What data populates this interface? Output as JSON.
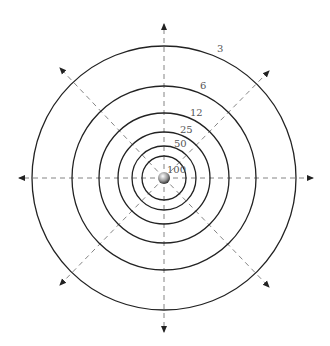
{
  "diagram": {
    "type": "concentric-rings",
    "center": {
      "x": 164,
      "y": 178
    },
    "rings": [
      {
        "label": "3",
        "radius": 132,
        "label_x": 217,
        "label_y": 52
      },
      {
        "label": "6",
        "radius": 92,
        "label_x": 200,
        "label_y": 89
      },
      {
        "label": "12",
        "radius": 65,
        "label_x": 190,
        "label_y": 116
      },
      {
        "label": "25",
        "radius": 46,
        "label_x": 180,
        "label_y": 133
      },
      {
        "label": "50",
        "radius": 32,
        "label_x": 174,
        "label_y": 147
      },
      {
        "label": "100",
        "radius": 22,
        "label_x": 167,
        "label_y": 173
      }
    ],
    "arrows": [
      {
        "name": "up",
        "x": 164,
        "y": 24
      },
      {
        "name": "down",
        "x": 164,
        "y": 332
      },
      {
        "name": "left",
        "x": 19,
        "y": 178
      },
      {
        "name": "right",
        "x": 313,
        "y": 178
      },
      {
        "name": "up-left",
        "x": 60,
        "y": 68
      },
      {
        "name": "up-right",
        "x": 269,
        "y": 71
      },
      {
        "name": "down-left",
        "x": 60,
        "y": 285
      },
      {
        "name": "down-right",
        "x": 269,
        "y": 287
      }
    ],
    "colors": {
      "ring": "#222222",
      "axis": "#777777",
      "label": "#555555"
    }
  }
}
